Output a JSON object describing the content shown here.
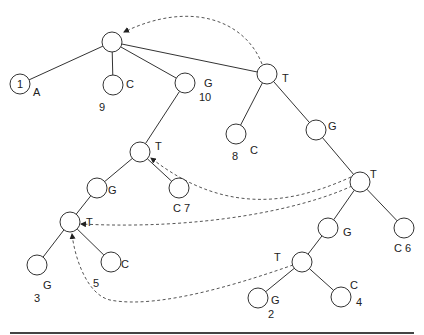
{
  "diagram": {
    "type": "suffix-tree",
    "node_radius": 10,
    "colors": {
      "line": "#333333",
      "dashed_link": "#555555",
      "node_fill": "#ffffff",
      "text": "#222222"
    },
    "nodes": [
      {
        "id": "root",
        "x": 112,
        "y": 42,
        "inner": "",
        "labels": []
      },
      {
        "id": "n1",
        "x": 20,
        "y": 84,
        "inner": "1",
        "labels": [
          {
            "text": "A",
            "x": 33,
            "y": 96
          }
        ]
      },
      {
        "id": "n9",
        "x": 113,
        "y": 85,
        "inner": "",
        "labels": [
          {
            "text": "C",
            "x": 126,
            "y": 88
          },
          {
            "text": "9",
            "x": 99,
            "y": 111
          }
        ]
      },
      {
        "id": "n10",
        "x": 185,
        "y": 83,
        "inner": "",
        "labels": [
          {
            "text": "G",
            "x": 204,
            "y": 87
          },
          {
            "text": "10",
            "x": 199,
            "y": 101
          }
        ]
      },
      {
        "id": "tTop",
        "x": 267,
        "y": 74,
        "inner": "",
        "labels": [
          {
            "text": "T",
            "x": 282,
            "y": 82
          }
        ]
      },
      {
        "id": "n8",
        "x": 236,
        "y": 134,
        "inner": "",
        "labels": [
          {
            "text": "8",
            "x": 232,
            "y": 160
          },
          {
            "text": "C",
            "x": 250,
            "y": 154
          }
        ]
      },
      {
        "id": "gRight",
        "x": 316,
        "y": 130,
        "inner": "",
        "labels": [
          {
            "text": "G",
            "x": 328,
            "y": 130
          }
        ]
      },
      {
        "id": "tRight",
        "x": 360,
        "y": 182,
        "inner": "",
        "labels": [
          {
            "text": "T",
            "x": 370,
            "y": 178
          }
        ]
      },
      {
        "id": "gMid",
        "x": 328,
        "y": 228,
        "inner": "",
        "labels": [
          {
            "text": "G",
            "x": 343,
            "y": 236
          }
        ]
      },
      {
        "id": "n6",
        "x": 404,
        "y": 228,
        "inner": "",
        "labels": [
          {
            "text": "C 6",
            "x": 394,
            "y": 252
          }
        ]
      },
      {
        "id": "tLow",
        "x": 302,
        "y": 262,
        "inner": "",
        "labels": [
          {
            "text": "T",
            "x": 274,
            "y": 261
          }
        ]
      },
      {
        "id": "n2",
        "x": 258,
        "y": 298,
        "inner": "",
        "labels": [
          {
            "text": "G",
            "x": 271,
            "y": 304
          },
          {
            "text": "2",
            "x": 268,
            "y": 318
          }
        ]
      },
      {
        "id": "n4",
        "x": 341,
        "y": 297,
        "inner": "",
        "labels": [
          {
            "text": "C",
            "x": 350,
            "y": 289
          },
          {
            "text": "4",
            "x": 356,
            "y": 306
          }
        ]
      },
      {
        "id": "tMidLeft",
        "x": 140,
        "y": 152,
        "inner": "",
        "labels": [
          {
            "text": "T",
            "x": 155,
            "y": 150
          }
        ]
      },
      {
        "id": "gLeft",
        "x": 97,
        "y": 188,
        "inner": "",
        "labels": [
          {
            "text": "G",
            "x": 108,
            "y": 194
          }
        ]
      },
      {
        "id": "n7",
        "x": 179,
        "y": 188,
        "inner": "",
        "labels": [
          {
            "text": "C 7",
            "x": 173,
            "y": 212
          }
        ]
      },
      {
        "id": "tLowLeft",
        "x": 70,
        "y": 222,
        "inner": "",
        "labels": [
          {
            "text": "T",
            "x": 86,
            "y": 226
          }
        ]
      },
      {
        "id": "n3",
        "x": 37,
        "y": 265,
        "inner": "",
        "labels": [
          {
            "text": "G",
            "x": 43,
            "y": 289
          },
          {
            "text": "3",
            "x": 34,
            "y": 302
          }
        ]
      },
      {
        "id": "n5",
        "x": 111,
        "y": 262,
        "inner": "",
        "labels": [
          {
            "text": "C",
            "x": 121,
            "y": 268
          },
          {
            "text": "5",
            "x": 93,
            "y": 287
          }
        ]
      }
    ],
    "edges": [
      [
        "root",
        "n1"
      ],
      [
        "root",
        "n9"
      ],
      [
        "root",
        "n10"
      ],
      [
        "root",
        "tTop"
      ],
      [
        "tTop",
        "n8"
      ],
      [
        "tTop",
        "gRight"
      ],
      [
        "gRight",
        "tRight"
      ],
      [
        "tRight",
        "gMid"
      ],
      [
        "tRight",
        "n6"
      ],
      [
        "gMid",
        "tLow"
      ],
      [
        "tLow",
        "n2"
      ],
      [
        "tLow",
        "n4"
      ],
      [
        "n10",
        "tMidLeft"
      ],
      [
        "tMidLeft",
        "gLeft"
      ],
      [
        "tMidLeft",
        "n7"
      ],
      [
        "gLeft",
        "tLowLeft"
      ],
      [
        "tLowLeft",
        "n3"
      ],
      [
        "tLowLeft",
        "n5"
      ]
    ],
    "suffix_links": [
      {
        "from": "tTop",
        "to": "root",
        "path": "M 262 64 C 245 20, 190 0, 124 32"
      },
      {
        "from": "tRight",
        "to": "tMidLeft",
        "path": "M 351 177 C 300 200, 230 220, 151 158"
      },
      {
        "from": "tRight",
        "to": "tLowLeft",
        "path": "M 352 186 C 300 210, 200 230, 81 224"
      },
      {
        "from": "tLow",
        "to": "tLowLeft",
        "path": "M 293 265 C 250 280, 160 310, 110 300 C 88 295, 75 260, 72 234"
      }
    ],
    "baseline_rule": {
      "x1": 10,
      "x2": 414,
      "y": 333
    }
  }
}
